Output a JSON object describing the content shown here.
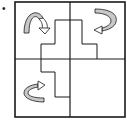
{
  "diagram": {
    "bullet": "•",
    "grid": {
      "rows": 2,
      "cols": 2
    },
    "quadrants": [
      {
        "position": "top-left",
        "arrow": "curved-arrow-down",
        "arrow_direction": "clockwise flip over top"
      },
      {
        "position": "top-right",
        "arrow": "curved-arrow-left",
        "arrow_direction": "clockwise turn pointing left"
      },
      {
        "position": "bottom-left",
        "arrow": "curved-arrow-right",
        "arrow_direction": "counterclockwise turn pointing right"
      },
      {
        "position": "bottom-right",
        "arrow": "none"
      }
    ],
    "colors": {
      "line": "#1a1a1a",
      "arrow_fill": "#c8c8c8",
      "background": "#ffffff"
    }
  }
}
